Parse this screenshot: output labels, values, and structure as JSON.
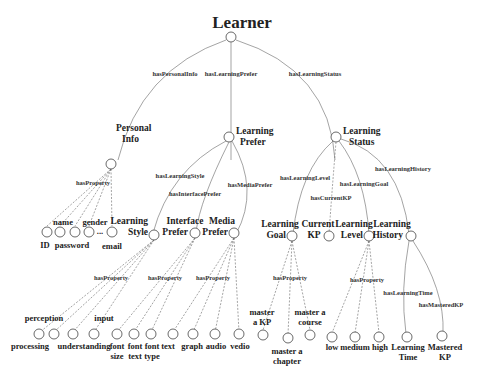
{
  "diagram": {
    "root": "Learner",
    "level1": {
      "personal_info": {
        "label_line1": "Personal",
        "label_line2": "Info",
        "edge": "hasPersonalInfo"
      },
      "learning_prefer": {
        "label_line1": "Learning",
        "label_line2": "Prefer",
        "edge": "hasLearningPrefer"
      },
      "learning_status": {
        "label_line1": "Learning",
        "label_line2": "Status",
        "edge": "hasLearningStatus"
      }
    },
    "personal_info_props": {
      "edge": "hasProperty",
      "top_labels": [
        "name",
        "gender"
      ],
      "bottom_labels": [
        "ID",
        "password",
        "email"
      ],
      "ellipsis": "..."
    },
    "prefer_children": {
      "learning_style": {
        "line1": "Learning",
        "line2": "Style",
        "edge": "hasLearningStyle"
      },
      "interface_prefer": {
        "line1": "Interface",
        "line2": "Prefer",
        "edge": "hasInterfacePrefer"
      },
      "media_prefer": {
        "line1": "Media",
        "line2": "Prefer",
        "edge": "hasMediaPrefer"
      }
    },
    "status_children": {
      "learning_goal": {
        "line1": "Learning",
        "line2": "Goal",
        "edge": "hasLearningGoal"
      },
      "current_kp": {
        "line1": "Current",
        "line2": "KP",
        "edge": "hasCurrentKP"
      },
      "learning_level": {
        "line1": "Learning",
        "line2": "Level",
        "edge": "hasLearningLevel"
      },
      "learning_history": {
        "line1": "Learning",
        "line2": "History",
        "edge": "hasLearningHistory"
      }
    },
    "style_props": {
      "edge": "hasProperty",
      "top": [
        "perception",
        "input"
      ],
      "bottom": [
        "processing",
        "understanding"
      ]
    },
    "interface_props": {
      "edge": "hasProperty",
      "items": [
        [
          "font",
          "size"
        ],
        [
          "font",
          "text"
        ],
        [
          "font",
          "type"
        ]
      ]
    },
    "media_props": {
      "edge": "hasProperty",
      "items": [
        "text",
        "graph",
        "audio",
        "vedio"
      ]
    },
    "goal_props": {
      "edge": "hasProperty",
      "top": [
        [
          "master",
          "a KP"
        ],
        [
          "master a",
          "course"
        ]
      ],
      "bottom": [
        [
          "master a",
          "chapter"
        ]
      ]
    },
    "level_props": {
      "edge": "hasProperty",
      "items": [
        "low",
        "medium",
        "high"
      ]
    },
    "history_props": {
      "time": {
        "edge": "hasLearningTime",
        "line1": "Learning",
        "line2": "Time"
      },
      "mastered": {
        "edge": "hasMasteredKP",
        "line1": "Mastered",
        "line2": "KP"
      }
    }
  }
}
